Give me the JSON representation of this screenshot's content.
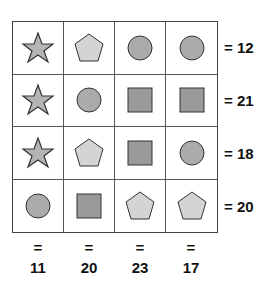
{
  "puzzle": {
    "grid": [
      [
        "star",
        "pentagon",
        "circle",
        "circle"
      ],
      [
        "star",
        "circle",
        "square",
        "square"
      ],
      [
        "star",
        "pentagon",
        "square",
        "circle"
      ],
      [
        "circle",
        "square",
        "pentagon",
        "pentagon"
      ]
    ],
    "row_sums": [
      "= 12",
      "= 21",
      "= 18",
      "= 20"
    ],
    "col_sums": [
      {
        "eq": "=",
        "value": "11"
      },
      {
        "eq": "=",
        "value": "20"
      },
      {
        "eq": "=",
        "value": "23"
      },
      {
        "eq": "=",
        "value": "17"
      }
    ],
    "colors": {
      "star": "#b4b4b4",
      "pentagon": "#d4d4d4",
      "circle": "#ababab",
      "square": "#9a9a9a",
      "stroke": "#333333"
    }
  }
}
